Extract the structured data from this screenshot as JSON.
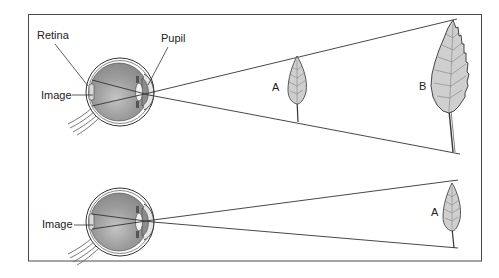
{
  "figure": {
    "frame_color": "#4a4a4a",
    "line_color": "#333333",
    "eye_fill": "#9a9a9a",
    "leaf_fill": "#cfcfcf",
    "top_panel": {
      "labels": {
        "retina": "Retina",
        "pupil": "Pupil",
        "image": "Image",
        "near_object": "A",
        "far_object": "B"
      }
    },
    "bottom_panel": {
      "labels": {
        "image": "Image",
        "object": "A"
      }
    }
  }
}
